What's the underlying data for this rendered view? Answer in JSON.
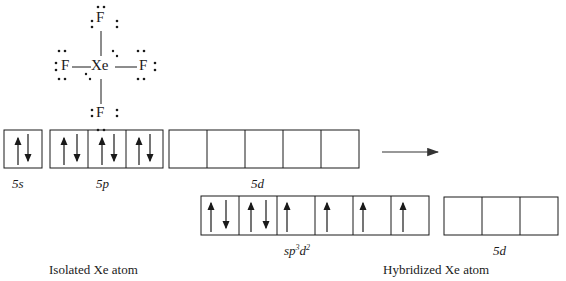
{
  "lewis_structure": {
    "central_atom": "Xe",
    "ligands": [
      "F",
      "F",
      "F",
      "F"
    ],
    "central_lone_pairs": 2
  },
  "isolated": {
    "caption": "Isolated Xe atom",
    "orbitals": [
      {
        "label": "5s",
        "cells": [
          [
            "up",
            "down"
          ]
        ]
      },
      {
        "label": "5p",
        "cells": [
          [
            "up",
            "down"
          ],
          [
            "up",
            "down"
          ],
          [
            "up",
            "down"
          ]
        ]
      },
      {
        "label": "5d",
        "cells": [
          [],
          [],
          [],
          [],
          []
        ]
      }
    ]
  },
  "hybridized": {
    "caption": "Hybridized Xe atom",
    "orbitals": [
      {
        "label": "sp",
        "label_sup1": "3",
        "label_mid": "d",
        "label_sup2": "2",
        "cells": [
          [
            "up",
            "down"
          ],
          [
            "up",
            "down"
          ],
          [
            "up"
          ],
          [
            "up"
          ],
          [
            "up"
          ],
          [
            "up"
          ]
        ]
      },
      {
        "label": "5d",
        "cells": [
          [],
          [],
          []
        ]
      }
    ]
  },
  "labels": {
    "s5": "5s",
    "p5": "5p",
    "d5": "5d",
    "hyb_sp": "sp",
    "hyb_sup1": "3",
    "hyb_d": "d",
    "hyb_sup2": "2",
    "hyb_d5": "5d",
    "xe": "Xe",
    "f": "F"
  },
  "colors": {
    "line": "#1a1a1a",
    "background": "#ffffff"
  }
}
